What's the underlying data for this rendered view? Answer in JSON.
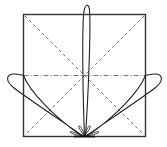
{
  "diagram": {
    "type": "radiation-pattern",
    "colors": {
      "background": "#ffffff",
      "frame": "#333333",
      "guides": "#555555",
      "lobes": "#222222"
    },
    "frame": {
      "x": 23,
      "y": 14,
      "width": 123,
      "height": 123
    },
    "origin": {
      "x": 84.5,
      "y": 137
    },
    "center": {
      "x": 84.5,
      "y": 75.5
    },
    "lobes": [
      {
        "name": "vertical-lobe",
        "direction": "up",
        "tip": {
          "x": 87,
          "y": 4
        }
      },
      {
        "name": "left-lobe",
        "direction": "upper-left",
        "tip": {
          "x": 8,
          "y": 77
        }
      },
      {
        "name": "right-lobe",
        "direction": "upper-right",
        "tip": {
          "x": 161,
          "y": 77
        }
      }
    ]
  }
}
